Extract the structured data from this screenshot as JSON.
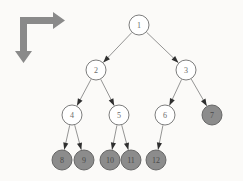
{
  "figure": {
    "background_color": "#fbfaf8"
  },
  "corner_arrow": {
    "icon_name": "right-down-arrow-icon",
    "color": "#8a8a8a",
    "description": "L-shaped arrow pointing right and down"
  },
  "colors": {
    "node_fill_white": "#ffffff",
    "node_fill_gray": "#8c8c8c",
    "node_stroke": "#6e6e6e",
    "node_stroke_gray": "#5d5d5d",
    "edge": "#7a7a7a",
    "arrowhead": "#2f2f2f",
    "label": "#6b6b6b"
  },
  "chart_data": {
    "type": "diagram",
    "nodes": [
      {
        "id": 1,
        "label": "1",
        "x": 139,
        "y": 25,
        "r": 10,
        "fill": "white",
        "level": 0
      },
      {
        "id": 2,
        "label": "2",
        "x": 96,
        "y": 70,
        "r": 10,
        "fill": "white",
        "level": 1
      },
      {
        "id": 3,
        "label": "3",
        "x": 186,
        "y": 70,
        "r": 10,
        "fill": "white",
        "level": 1
      },
      {
        "id": 4,
        "label": "4",
        "x": 72,
        "y": 115,
        "r": 10,
        "fill": "white",
        "level": 2
      },
      {
        "id": 5,
        "label": "5",
        "x": 119,
        "y": 115,
        "r": 10,
        "fill": "white",
        "level": 2
      },
      {
        "id": 6,
        "label": "6",
        "x": 165,
        "y": 115,
        "r": 10,
        "fill": "white",
        "level": 2
      },
      {
        "id": 7,
        "label": "7",
        "x": 212,
        "y": 115,
        "r": 10,
        "fill": "gray",
        "level": 2
      },
      {
        "id": 8,
        "label": "8",
        "x": 62,
        "y": 160,
        "r": 10,
        "fill": "gray",
        "level": 3
      },
      {
        "id": 9,
        "label": "9",
        "x": 84,
        "y": 160,
        "r": 10,
        "fill": "gray",
        "level": 3
      },
      {
        "id": 10,
        "label": "10",
        "x": 110,
        "y": 160,
        "r": 10,
        "fill": "gray",
        "level": 3
      },
      {
        "id": 11,
        "label": "11",
        "x": 131,
        "y": 160,
        "r": 10,
        "fill": "gray",
        "level": 3
      },
      {
        "id": 12,
        "label": "12",
        "x": 156,
        "y": 160,
        "r": 10,
        "fill": "gray",
        "level": 3
      }
    ],
    "edges": [
      {
        "from": 1,
        "to": 2
      },
      {
        "from": 1,
        "to": 3
      },
      {
        "from": 2,
        "to": 4
      },
      {
        "from": 2,
        "to": 5
      },
      {
        "from": 3,
        "to": 6
      },
      {
        "from": 3,
        "to": 7
      },
      {
        "from": 4,
        "to": 8
      },
      {
        "from": 4,
        "to": 9
      },
      {
        "from": 5,
        "to": 10
      },
      {
        "from": 5,
        "to": 11
      },
      {
        "from": 6,
        "to": 12
      }
    ],
    "legend": []
  }
}
